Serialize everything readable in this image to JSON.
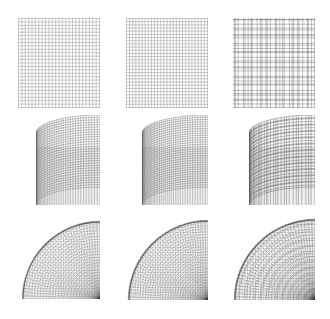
{
  "figure": {
    "layout": {
      "rows": 3,
      "cols": 3
    },
    "line_color": "#333333",
    "background": "#ffffff",
    "rows": [
      {
        "shape": "flat-square-grid",
        "panels": [
          {
            "x": 18,
            "y": 18,
            "w": 82,
            "h": 90,
            "nx": 24,
            "ny": 26,
            "refine": "uniform"
          },
          {
            "x": 126,
            "y": 18,
            "w": 82,
            "h": 90,
            "nx": 26,
            "ny": 28,
            "refine": "uniform-fine"
          },
          {
            "x": 233,
            "y": 18,
            "w": 82,
            "h": 90,
            "nx": 28,
            "ny": 30,
            "refine": "clustered"
          }
        ]
      },
      {
        "shape": "cylinder",
        "panels": [
          {
            "x": 36,
            "y": 115,
            "w": 64,
            "h": 90,
            "nu": 36,
            "nv": 30,
            "refine": "uniform"
          },
          {
            "x": 142,
            "y": 115,
            "w": 66,
            "h": 90,
            "nu": 40,
            "nv": 32,
            "refine": "uniform-fine"
          },
          {
            "x": 249,
            "y": 115,
            "w": 66,
            "h": 90,
            "nu": 32,
            "nv": 34,
            "refine": "clustered"
          }
        ]
      },
      {
        "shape": "quarter-disc",
        "panels": [
          {
            "x": 22,
            "y": 220,
            "w": 78,
            "h": 79,
            "nr": 26,
            "nt": 34,
            "refine": "uniform"
          },
          {
            "x": 127,
            "y": 220,
            "w": 81,
            "h": 80,
            "nr": 28,
            "nt": 36,
            "refine": "uniform-fine"
          },
          {
            "x": 234,
            "y": 218,
            "w": 81,
            "h": 82,
            "nr": 26,
            "nt": 34,
            "refine": "clustered"
          }
        ]
      }
    ]
  }
}
